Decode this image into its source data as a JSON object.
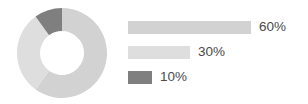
{
  "chart_data": {
    "type": "pie",
    "variant": "donut",
    "title": "",
    "subtitle": "",
    "xlabel": "",
    "ylabel": "",
    "grid": false,
    "legend_position": "right",
    "legend_style": "horizontal-bars-proportional",
    "start_angle_deg": 0,
    "direction": "clockwise",
    "outer_radius_px": 45,
    "inner_radius_px": 22,
    "center_px": [
      62,
      53
    ],
    "categories": [
      "Segment 1",
      "Segment 2",
      "Segment 3"
    ],
    "values": [
      60,
      30,
      10
    ],
    "value_labels": [
      "60%",
      "30%",
      "10%"
    ],
    "colors": [
      "#d2d2d2",
      "#dedede",
      "#7f7f7f"
    ],
    "series": [
      {
        "name": "Share",
        "values": [
          60,
          30,
          10
        ]
      }
    ],
    "slices": [
      {
        "label": "60%",
        "value": 60,
        "color": "#d2d2d2",
        "start_deg": 0,
        "end_deg": 216
      },
      {
        "label": "30%",
        "value": 30,
        "color": "#dedede",
        "start_deg": 216,
        "end_deg": 324
      },
      {
        "label": "10%",
        "value": 10,
        "color": "#7f7f7f",
        "start_deg": 324,
        "end_deg": 360
      }
    ]
  },
  "legend": {
    "items": [
      {
        "label": "60%",
        "value": 60,
        "color": "#d2d2d2",
        "bar_width_px": 123
      },
      {
        "label": "30%",
        "value": 30,
        "color": "#dedede",
        "bar_width_px": 62
      },
      {
        "label": "10%",
        "value": 10,
        "color": "#7f7f7f",
        "bar_width_px": 24
      }
    ]
  },
  "colors": {
    "background": "#ffffff",
    "text": "#4a4a4a",
    "slice_large": "#d2d2d2",
    "slice_medium": "#dedede",
    "slice_small": "#7f7f7f"
  }
}
